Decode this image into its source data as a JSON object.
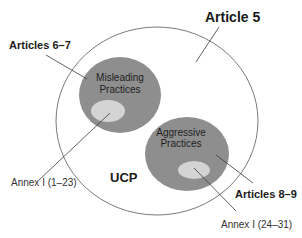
{
  "diagram": {
    "outer_set": {
      "label": "UCP",
      "pointer_label": "Article 5"
    },
    "subsets": [
      {
        "name": "misleading",
        "title_line1": "Misleading",
        "title_line2": "Practices",
        "pointer_label": "Articles 6–7",
        "inner_label": "Annex I (1–23)"
      },
      {
        "name": "aggressive",
        "title_line1": "Aggressive",
        "title_line2": "Practices",
        "pointer_label": "Articles 8–9",
        "inner_label": "Annex I (24–31)"
      }
    ],
    "colors": {
      "outer_stroke": "#7a7a7a",
      "subset_fill": "#8e8e8e",
      "inner_fill": "#d4d4d4",
      "leader_line": "#3a3a3a"
    }
  }
}
